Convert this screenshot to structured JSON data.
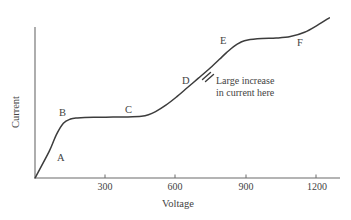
{
  "chart_data": {
    "type": "line",
    "title": "",
    "subtitle": "",
    "xlabel": "Voltage",
    "ylabel": "Current",
    "xlim": [
      0,
      1290
    ],
    "ylim": [
      0,
      1
    ],
    "grid": false,
    "legend": null,
    "xticks": [
      {
        "value": 300,
        "label": "300"
      },
      {
        "value": 600,
        "label": "600"
      },
      {
        "value": 900,
        "label": "900"
      },
      {
        "value": 1200,
        "label": "1200"
      }
    ],
    "yticks": [],
    "series": [
      {
        "name": "current-voltage curve",
        "x": [
          0,
          60,
          90,
          120,
          150,
          180,
          210,
          270,
          330,
          390,
          450,
          480,
          510,
          555,
          600,
          645,
          690,
          735,
          780,
          810,
          840,
          870,
          900,
          960,
          1020,
          1080,
          1140,
          1200,
          1245
        ],
        "values": [
          0.0,
          0.16,
          0.26,
          0.33,
          0.355,
          0.362,
          0.365,
          0.366,
          0.367,
          0.368,
          0.372,
          0.381,
          0.4,
          0.44,
          0.49,
          0.545,
          0.6,
          0.655,
          0.715,
          0.755,
          0.792,
          0.818,
          0.832,
          0.84,
          0.843,
          0.852,
          0.878,
          0.925,
          0.965
        ]
      }
    ],
    "point_labels": [
      {
        "id": "A",
        "label": "A",
        "x_px": 60,
        "y_px": 158
      },
      {
        "id": "B",
        "label": "B",
        "x_px": 62,
        "y_px": 113
      },
      {
        "id": "C",
        "label": "C",
        "x_px": 128,
        "y_px": 110
      },
      {
        "id": "D",
        "label": "D",
        "x_px": 185,
        "y_px": 81
      },
      {
        "id": "E",
        "label": "E",
        "x_px": 223,
        "y_px": 41
      },
      {
        "id": "F",
        "label": "F",
        "x_px": 300,
        "y_px": 43
      }
    ],
    "markers": [
      {
        "name": "cross-hatch-marker",
        "x_px": 207,
        "y_px": 76,
        "description": "double slash mark crossing the curve"
      }
    ],
    "annotations": [
      {
        "name": "large-increase-note",
        "line1": "Large increase",
        "line2": "in current here",
        "x_px": 217,
        "y_px": 79
      }
    ],
    "colors": {
      "background": "#ffffff",
      "curve": "#3c3c3c",
      "axis": "#6b6b6b",
      "text": "#434343"
    }
  }
}
